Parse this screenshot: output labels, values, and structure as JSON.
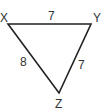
{
  "diagram": {
    "type": "triangle",
    "vertices": [
      {
        "name": "X",
        "x": 8,
        "y": 24
      },
      {
        "name": "Y",
        "x": 91,
        "y": 24
      },
      {
        "name": "Z",
        "x": 59,
        "y": 93
      }
    ],
    "sides": [
      {
        "from": "X",
        "to": "Y",
        "length": "7"
      },
      {
        "from": "Y",
        "to": "Z",
        "length": "7"
      },
      {
        "from": "X",
        "to": "Z",
        "length": "8"
      }
    ],
    "line_color": "#222222"
  }
}
